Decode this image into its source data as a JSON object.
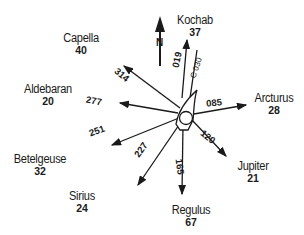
{
  "diagram": {
    "north_label": "N",
    "course_label": "C 030",
    "stars": [
      {
        "name": "Kochab",
        "altitude": "37",
        "bearing": "019"
      },
      {
        "name": "Arcturus",
        "altitude": "28",
        "bearing": "085"
      },
      {
        "name": "Jupiter",
        "altitude": "21",
        "bearing": "120"
      },
      {
        "name": "Regulus",
        "altitude": "67",
        "bearing": "165"
      },
      {
        "name": "Sirius",
        "altitude": "24",
        "bearing": "227"
      },
      {
        "name": "Betelgeuse",
        "altitude": "32",
        "bearing": "251"
      },
      {
        "name": "Aldebaran",
        "altitude": "20",
        "bearing": "277"
      },
      {
        "name": "Capella",
        "altitude": "40",
        "bearing": "314"
      }
    ]
  }
}
